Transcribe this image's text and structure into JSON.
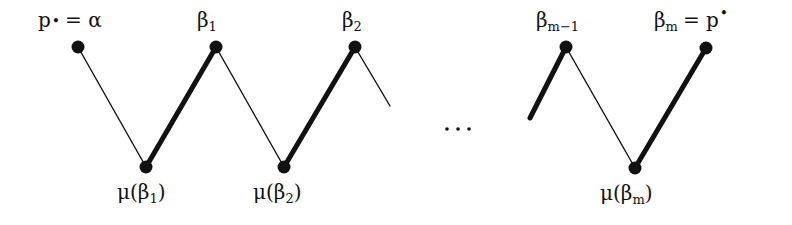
{
  "diagram": {
    "colors": {
      "ink": "#111111",
      "background": "#ffffff"
    },
    "top_nodes": [
      {
        "id": "p_bullet_alpha",
        "label_main": "p",
        "label_sup_or_sub": "•",
        "label_rest": " = α",
        "x": 78,
        "y": 47
      },
      {
        "id": "beta_1",
        "label_main": "β",
        "label_sub": "1",
        "x": 216,
        "y": 47
      },
      {
        "id": "beta_2",
        "label_main": "β",
        "label_sub": "2",
        "x": 355,
        "y": 47
      },
      {
        "id": "beta_m_minus_1",
        "label_main": "β",
        "label_sub": "m−1",
        "x": 566,
        "y": 47
      },
      {
        "id": "beta_m",
        "label_main": "β",
        "label_sub": "m",
        "label_rest": " = p",
        "label_sup": "•",
        "x": 706,
        "y": 48
      }
    ],
    "bottom_nodes": [
      {
        "id": "mu_beta_1",
        "label_prefix": "μ(β",
        "label_sub": "1",
        "label_suffix": ")",
        "x": 146,
        "y": 167
      },
      {
        "id": "mu_beta_2",
        "label_prefix": "μ(β",
        "label_sub": "2",
        "label_suffix": ")",
        "x": 284,
        "y": 167
      },
      {
        "id": "mu_beta_m",
        "label_prefix": "μ(β",
        "label_sub": "m",
        "label_suffix": ")",
        "x": 635,
        "y": 168
      }
    ],
    "edges": [
      {
        "from": "p_bullet_alpha",
        "to": "mu_beta_1",
        "style": "thin"
      },
      {
        "from": "mu_beta_1",
        "to": "beta_1",
        "style": "thick"
      },
      {
        "from": "beta_1",
        "to": "mu_beta_2",
        "style": "thin"
      },
      {
        "from": "mu_beta_2",
        "to": "beta_2",
        "style": "thick"
      },
      {
        "from": "beta_2",
        "to": "continues",
        "style": "thin",
        "partial": true
      },
      {
        "from": "continues",
        "to": "beta_m_minus_1",
        "style": "thick",
        "partial": true
      },
      {
        "from": "beta_m_minus_1",
        "to": "mu_beta_m",
        "style": "thin"
      },
      {
        "from": "mu_beta_m",
        "to": "beta_m",
        "style": "thick"
      }
    ],
    "ellipsis": "⋯",
    "labels": {
      "p_main": "p",
      "bullet": "•",
      "eq_alpha": "= α",
      "beta": "β",
      "sub_1": "1",
      "sub_2": "2",
      "sub_m_minus_1": "m−1",
      "sub_m": "m",
      "eq_p": "= p",
      "mu_open": "μ(β",
      "close_paren": ")"
    }
  }
}
